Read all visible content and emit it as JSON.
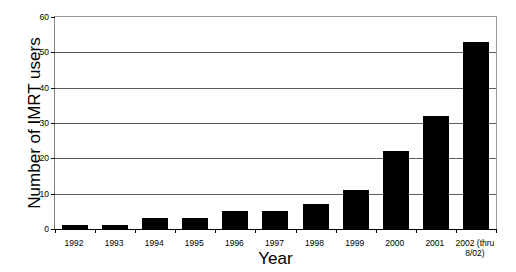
{
  "chart_data": {
    "type": "bar",
    "title": "",
    "xlabel": "Year",
    "ylabel": "Number of IMRT users",
    "categories": [
      "1992",
      "1993",
      "1994",
      "1995",
      "1996",
      "1997",
      "1998",
      "1999",
      "2000",
      "2001",
      "2002 (thru 8/02)"
    ],
    "category_lines": [
      [
        "1992"
      ],
      [
        "1993"
      ],
      [
        "1994"
      ],
      [
        "1995"
      ],
      [
        "1996"
      ],
      [
        "1997"
      ],
      [
        "1998"
      ],
      [
        "1999"
      ],
      [
        "2000"
      ],
      [
        "2001"
      ],
      [
        "2002 (thru",
        "8/02)"
      ]
    ],
    "values": [
      1,
      1,
      3,
      3,
      5,
      5,
      7,
      11,
      22,
      32,
      53
    ],
    "ylim": [
      0,
      60
    ],
    "ytick_labels": [
      "0",
      "10",
      "20",
      "30",
      "40",
      "50",
      "60"
    ],
    "ytick_values": [
      0,
      10,
      20,
      30,
      40,
      50,
      60
    ],
    "grid": true,
    "legend": "none",
    "bar_color": "#000000",
    "grid_color": "#5a5a5a",
    "axis_color": "#000000",
    "background_color": "#ffffff"
  }
}
